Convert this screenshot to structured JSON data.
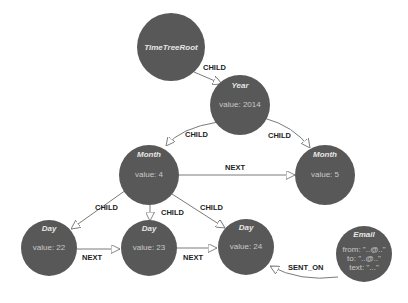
{
  "diagram": {
    "nodes": {
      "root": {
        "title": "TimeTreeRoot"
      },
      "year": {
        "title": "Year",
        "value": "value: 2014"
      },
      "month4": {
        "title": "Month",
        "value": "value: 4"
      },
      "month5": {
        "title": "Month",
        "value": "value: 5"
      },
      "day22": {
        "title": "Day",
        "value": "value: 22"
      },
      "day23": {
        "title": "Day",
        "value": "value: 23"
      },
      "day24": {
        "title": "Day",
        "value": "value: 24"
      },
      "email": {
        "title": "Email",
        "from": "from: \"..@..\"",
        "to": "to: \"..@..\"",
        "text": "text: \"...\""
      }
    },
    "edges": {
      "root_year": "CHILD",
      "year_month4": "CHILD",
      "year_month5": "CHILD",
      "month4_month5": "NEXT",
      "month4_day22": "CHILD",
      "month4_day23": "CHILD",
      "month4_day24": "CHILD",
      "day22_day23": "NEXT",
      "day23_day24": "NEXT",
      "email_day24": "SENT_ON"
    },
    "colors": {
      "node": "#585858",
      "edge": "#7a7a7a",
      "label": "#222222"
    }
  }
}
